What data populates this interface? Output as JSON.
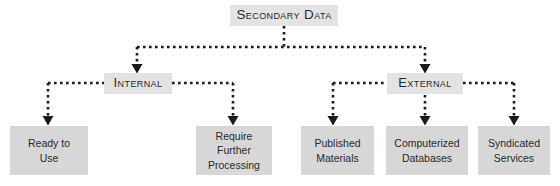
{
  "diagram": {
    "type": "hierarchy-tree",
    "colors": {
      "canvas_background": "#ffffff",
      "root_node_fill": "#e3e3e3",
      "branch_node_fill": "#e3e3e3",
      "leaf_node_fill": "#d7d7d7",
      "text": "#2b2b2b",
      "connector": "#1a1a1a"
    },
    "root": {
      "label": "Secondary Data",
      "level": 0
    },
    "branches": [
      {
        "id": "internal",
        "label": "Internal",
        "level": 1
      },
      {
        "id": "external",
        "label": "External",
        "level": 1
      }
    ],
    "leaves": [
      {
        "id": "ready-to-use",
        "label": "Ready to\nUse",
        "parent": "internal",
        "level": 2
      },
      {
        "id": "require-further-processing",
        "label": "Require\nFurther\nProcessing",
        "parent": "internal",
        "level": 2
      },
      {
        "id": "published-materials",
        "label": "Published\nMaterials",
        "parent": "external",
        "level": 2
      },
      {
        "id": "computerized-databases",
        "label": "Computerized\nDatabases",
        "parent": "external",
        "level": 2
      },
      {
        "id": "syndicated-services",
        "label": "Syndicated\nServices",
        "parent": "external",
        "level": 2
      }
    ],
    "connector_style": {
      "line": "dotted",
      "arrowhead": "filled-triangle",
      "dot_size": 3,
      "dot_gap": 3
    }
  }
}
